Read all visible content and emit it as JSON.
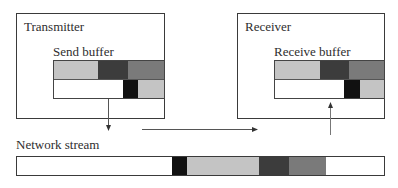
{
  "transmitter": {
    "title": "Transmitter",
    "buffer_label": "Send buffer",
    "buffer": {
      "top_row": [
        {
          "width": 44,
          "shade": "light",
          "color": "#c4c4c4"
        },
        {
          "width": 31,
          "shade": "dark",
          "color": "#3c3c3c"
        },
        {
          "width": 36,
          "shade": "medium",
          "color": "#7a7a7a"
        }
      ],
      "bottom_row": [
        {
          "width": 70,
          "shade": "empty",
          "color": "#ffffff"
        },
        {
          "width": 15,
          "shade": "black",
          "color": "#111111"
        },
        {
          "width": 26,
          "shade": "light",
          "color": "#c4c4c4"
        }
      ]
    }
  },
  "receiver": {
    "title": "Receiver",
    "buffer_label": "Receive buffer",
    "buffer": {
      "top_row": [
        {
          "width": 45,
          "shade": "light",
          "color": "#c4c4c4"
        },
        {
          "width": 30,
          "shade": "dark",
          "color": "#3c3c3c"
        },
        {
          "width": 35,
          "shade": "medium",
          "color": "#7a7a7a"
        }
      ],
      "bottom_row": [
        {
          "width": 70,
          "shade": "empty",
          "color": "#ffffff"
        },
        {
          "width": 16,
          "shade": "black",
          "color": "#111111"
        },
        {
          "width": 24,
          "shade": "light",
          "color": "#c4c4c4"
        }
      ]
    }
  },
  "network": {
    "label": "Network stream",
    "segments": [
      {
        "width": 155,
        "shade": "empty",
        "color": "#ffffff"
      },
      {
        "width": 15,
        "shade": "black",
        "color": "#111111"
      },
      {
        "width": 73,
        "shade": "light",
        "color": "#c4c4c4"
      },
      {
        "width": 30,
        "shade": "dark",
        "color": "#3c3c3c"
      },
      {
        "width": 37,
        "shade": "medium",
        "color": "#7a7a7a"
      },
      {
        "width": 58,
        "shade": "empty",
        "color": "#ffffff"
      }
    ]
  },
  "arrows": [
    {
      "name": "send-to-stream",
      "direction": "down"
    },
    {
      "name": "stream-flow",
      "direction": "right"
    },
    {
      "name": "stream-to-receive",
      "direction": "up"
    }
  ]
}
